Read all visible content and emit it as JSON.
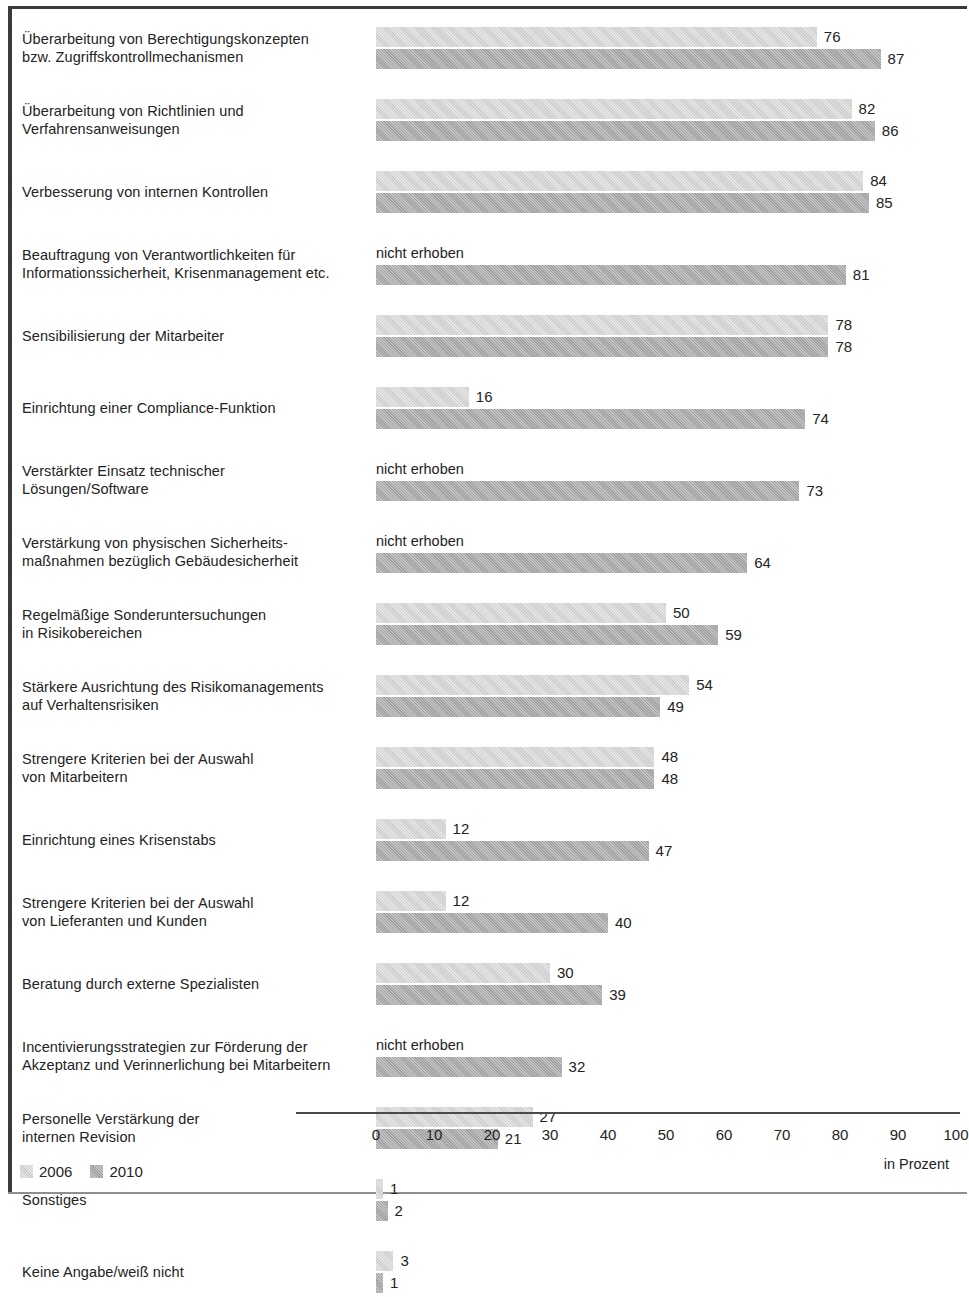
{
  "chart_data": {
    "type": "bar",
    "orientation": "horizontal",
    "title": "",
    "xlabel": "in Prozent",
    "ylabel": "",
    "xlim": [
      0,
      100
    ],
    "xticks": [
      "0",
      "10",
      "20",
      "30",
      "40",
      "50",
      "60",
      "70",
      "80",
      "90",
      "100"
    ],
    "grid": false,
    "legend_position": "bottom-left",
    "not_surveyed_label": "nicht erhoben",
    "series": [
      {
        "name": "2006",
        "color": "#d3d3d3"
      },
      {
        "name": "2010",
        "color": "#a9a9a9"
      }
    ],
    "categories": [
      "Überarbeitung von Berechtigungskonzepten\nbzw. Zugriffskontrollmechanismen",
      "Überarbeitung von Richtlinien und\nVerfahrensanweisungen",
      "Verbesserung von internen Kontrollen",
      "Beauftragung von Verantwortlichkeiten für\nInformationssicherheit, Krisenmanagement etc.",
      "Sensibilisierung der Mitarbeiter",
      "Einrichtung einer Compliance-Funktion",
      "Verstärkter Einsatz technischer\nLösungen/Software",
      "Verstärkung von physischen Sicherheits-\nmaßnahmen bezüglich Gebäudesicherheit",
      "Regelmäßige Sonderuntersuchungen\nin Risikobereichen",
      "Stärkere Ausrichtung des Risikomanagements\nauf Verhaltensrisiken",
      "Strengere Kriterien bei der Auswahl\nvon Mitarbeitern",
      "Einrichtung eines Krisenstabs",
      "Strengere Kriterien bei der Auswahl\nvon Lieferanten und Kunden",
      "Beratung durch externe Spezialisten",
      "Incentivierungsstrategien zur Förderung der\nAkzeptanz und Verinnerlichung bei Mitarbeitern",
      "Personelle Verstärkung der\ninternen Revision",
      "Sonstiges",
      "Keine Angabe/weiß nicht"
    ],
    "values_2006": [
      76,
      82,
      84,
      null,
      78,
      16,
      null,
      null,
      50,
      54,
      48,
      12,
      12,
      30,
      null,
      27,
      1,
      3
    ],
    "values_2010": [
      87,
      86,
      85,
      81,
      78,
      74,
      73,
      64,
      59,
      49,
      48,
      47,
      40,
      39,
      32,
      21,
      2,
      1
    ]
  },
  "legend": {
    "items": [
      {
        "label": "2006"
      },
      {
        "label": "2010"
      }
    ]
  },
  "axis": {
    "unit_label": "in Prozent"
  }
}
